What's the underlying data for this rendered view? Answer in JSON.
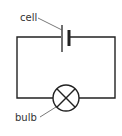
{
  "diagram": {
    "type": "circuit",
    "labels": {
      "cell": "cell",
      "bulb": "bulb"
    },
    "components": [
      {
        "name": "cell",
        "symbol": "battery-cell"
      },
      {
        "name": "bulb",
        "symbol": "lamp-circle-cross"
      }
    ],
    "colors": {
      "wire": "#222222",
      "text": "#333333",
      "background": "#ffffff"
    }
  }
}
